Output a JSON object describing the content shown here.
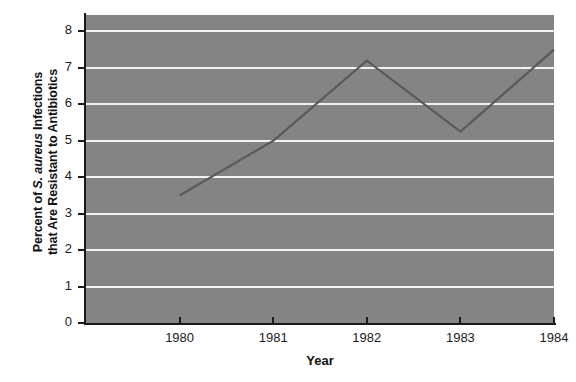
{
  "chart_data": {
    "type": "line",
    "title": "",
    "subtitle": "",
    "xlabel": "Year",
    "ylabel_line1": "Percent of S. aureus Infections",
    "ylabel_line2": "that Are Resistant to Antibiotics",
    "ylabel_italic_part": "S. aureus",
    "ylabel_full": "Percent of S. aureus Infections that Are Resistant to Antibiotics",
    "x": [
      1980,
      1981,
      1982,
      1983,
      1984
    ],
    "categories": [
      "1980",
      "1981",
      "1982",
      "1983",
      "1984"
    ],
    "values": [
      3.5,
      5.0,
      7.2,
      5.25,
      7.5
    ],
    "series": [
      {
        "name": "Percent Resistant",
        "values": [
          3.5,
          5.0,
          7.2,
          5.25,
          7.5
        ]
      }
    ],
    "xlim": [
      1979.0,
      1984.0
    ],
    "ylim": [
      0,
      8.45
    ],
    "yticks": [
      0,
      1,
      2,
      3,
      4,
      5,
      6,
      7,
      8
    ],
    "ytick_labels": [
      "0",
      "1",
      "2",
      "3",
      "4",
      "5",
      "6",
      "7",
      "8"
    ],
    "xticks": [
      1980,
      1981,
      1982,
      1983,
      1984
    ],
    "xtick_labels": [
      "1980",
      "1981",
      "1982",
      "1983",
      "1984"
    ],
    "grid": true,
    "grid_axis": "y",
    "legend": false,
    "legend_position": "none",
    "plot_background_color": "#848484",
    "gridline_color": "#f2f2f2",
    "line_color": "#5a5a5a",
    "axis_color": "#1a1a1a",
    "figure_background_color": "#ffffff",
    "annotations": []
  }
}
